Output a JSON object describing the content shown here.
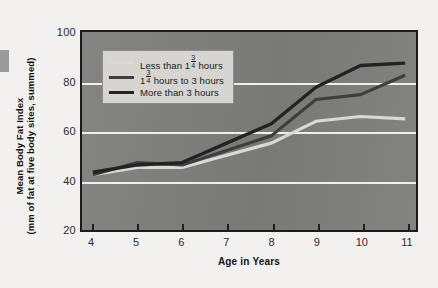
{
  "chart_data": {
    "type": "line",
    "title": "",
    "xlabel": "Age in Years",
    "ylabel": "Mean Body Fat Index (mm of fat at five body sites, summed)",
    "ylabel_line1": "Mean Body Fat Index",
    "ylabel_line2": "(mm of fat at five body sites, summed)",
    "x": [
      4,
      5,
      6,
      7,
      8,
      9,
      10,
      11
    ],
    "xtick_labels": [
      "4",
      "5",
      "6",
      "7",
      "8",
      "9",
      "10",
      "11"
    ],
    "ytick_labels": [
      "20",
      "40",
      "60",
      "80",
      "100"
    ],
    "yticks": [
      20,
      40,
      60,
      80,
      100
    ],
    "ylim": [
      20,
      100
    ],
    "xlim": [
      4,
      11
    ],
    "gridlines": [
      40,
      60,
      80
    ],
    "grid": true,
    "grid_color": "#efefec",
    "plot_background": "#7e7e7d",
    "legend_position": "upper-left-inside",
    "series": [
      {
        "name": "Less than 1¾ hours",
        "label_prefix": "Less than 1",
        "label_fraction_num": "3",
        "label_fraction_den": "4",
        "label_suffix": " hours",
        "color": "#d9d9d5",
        "width": 3.2,
        "values": [
          42,
          45,
          45,
          50,
          55,
          64,
          66,
          65
        ]
      },
      {
        "name": "1¾ hours to 3 hours",
        "label_prefix": "1",
        "label_fraction_num": "3",
        "label_fraction_den": "4",
        "label_suffix": " hours to 3 hours",
        "color": "#3e3e3e",
        "width": 3.2,
        "values": [
          42,
          47,
          46,
          52,
          58,
          73,
          75,
          83
        ]
      },
      {
        "name": "More than 3 hours",
        "label_prefix": "More than 3 hours",
        "label_fraction_num": "",
        "label_fraction_den": "",
        "label_suffix": "",
        "color": "#232323",
        "width": 3.4,
        "values": [
          43,
          46,
          47,
          55,
          63,
          78,
          87,
          88
        ]
      }
    ]
  }
}
